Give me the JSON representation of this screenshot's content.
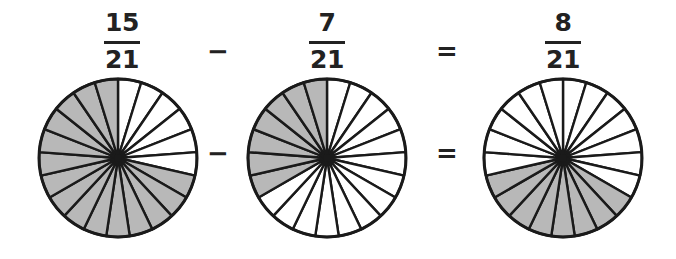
{
  "figure": {
    "type": "fraction-subtraction-pie-diagram",
    "background_color": "#ffffff",
    "shaded_color": "#b8b8b8",
    "line_color": "#1a1a1a",
    "text_color": "#222222",
    "denominator_sectors": 21
  },
  "equation": {
    "terms": [
      {
        "numerator": "15",
        "denominator": "21"
      },
      {
        "numerator": "7",
        "denominator": "21"
      },
      {
        "numerator": "8",
        "denominator": "21"
      }
    ],
    "operators": [
      {
        "symbol": "−",
        "name": "minus"
      },
      {
        "symbol": "=",
        "name": "equals"
      }
    ]
  },
  "pies": [
    {
      "label": "15/21",
      "total_sectors": 21,
      "shaded_sectors": 15,
      "unshaded_sectors": 6,
      "shaded_start_index": 6,
      "center_x": 118,
      "center_y": 86,
      "radius": 79
    },
    {
      "label": "7/21",
      "total_sectors": 21,
      "shaded_sectors": 7,
      "unshaded_sectors": 14,
      "shaded_start_index": 14,
      "center_x": 327,
      "center_y": 86,
      "radius": 79
    },
    {
      "label": "8/21",
      "total_sectors": 21,
      "shaded_sectors": 8,
      "unshaded_sectors": 13,
      "shaded_start_index": 7,
      "center_x": 563,
      "center_y": 86,
      "radius": 79
    }
  ],
  "positions": {
    "fraction_x": [
      122,
      327,
      563
    ],
    "operator_top_x": [
      218,
      447
    ],
    "operator_mid_x": [
      218,
      447
    ]
  },
  "chart_data": {
    "type": "pie",
    "title": "15/21 − 7/21 = 8/21",
    "xlabel": "",
    "ylabel": "",
    "charts": [
      {
        "name": "15/21",
        "categories": [
          "shaded",
          "unshaded"
        ],
        "values": [
          15,
          6
        ],
        "total": 21
      },
      {
        "name": "7/21",
        "categories": [
          "shaded",
          "unshaded"
        ],
        "values": [
          7,
          14
        ],
        "total": 21
      },
      {
        "name": "8/21",
        "categories": [
          "shaded",
          "unshaded"
        ],
        "values": [
          8,
          13
        ],
        "total": 21
      }
    ],
    "legend": [],
    "grid": false
  }
}
